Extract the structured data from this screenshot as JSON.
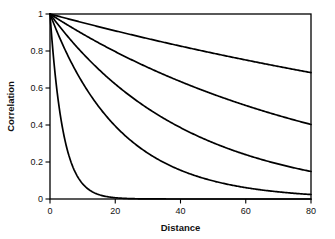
{
  "chart_data": {
    "type": "line",
    "title": "",
    "subtitle": "",
    "xlabel": "Distance",
    "ylabel": "Correlation",
    "xlim": [
      0,
      80
    ],
    "ylim": [
      0,
      1
    ],
    "xticks": [
      0,
      20,
      40,
      60,
      80
    ],
    "xtick_labels": [
      "0",
      "20",
      "40",
      "60",
      "80"
    ],
    "yticks": [
      0,
      0.2,
      0.4,
      0.6,
      0.8,
      1
    ],
    "ytick_labels": [
      "0",
      "0.2",
      "0.4",
      "0.6",
      "0.8",
      "1"
    ],
    "grid": false,
    "legend": "none",
    "line_color": "#000000",
    "background_color": "#ffffff",
    "x": [
      0,
      5,
      10,
      15,
      20,
      25,
      30,
      35,
      40,
      45,
      50,
      55,
      60,
      65,
      70,
      75,
      80
    ],
    "series": [
      {
        "name": "range 210",
        "range": 210,
        "values": [
          1.0,
          0.976,
          0.953,
          0.931,
          0.909,
          0.887,
          0.866,
          0.846,
          0.826,
          0.806,
          0.787,
          0.769,
          0.751,
          0.733,
          0.716,
          0.699,
          0.683
        ]
      },
      {
        "name": "range 88",
        "range": 88,
        "values": [
          1.0,
          0.945,
          0.893,
          0.844,
          0.797,
          0.753,
          0.712,
          0.673,
          0.636,
          0.601,
          0.568,
          0.536,
          0.507,
          0.479,
          0.453,
          0.428,
          0.404
        ]
      },
      {
        "name": "range 42",
        "range": 42,
        "values": [
          1.0,
          0.888,
          0.788,
          0.699,
          0.621,
          0.551,
          0.489,
          0.434,
          0.386,
          0.342,
          0.304,
          0.269,
          0.239,
          0.212,
          0.189,
          0.167,
          0.149
        ]
      },
      {
        "name": "range 21.5",
        "range": 21.5,
        "values": [
          1.0,
          0.792,
          0.627,
          0.497,
          0.394,
          0.312,
          0.247,
          0.196,
          0.155,
          0.123,
          0.097,
          0.077,
          0.061,
          0.048,
          0.038,
          0.03,
          0.024
        ]
      },
      {
        "name": "range 4",
        "range": 4,
        "values": [
          1.0,
          0.287,
          0.082,
          0.024,
          0.007,
          0.002,
          0.0005,
          0.0002,
          0.0,
          0.0,
          0.0,
          0.0,
          0.0,
          0.0,
          0.0,
          0.0,
          0.0
        ]
      }
    ]
  }
}
